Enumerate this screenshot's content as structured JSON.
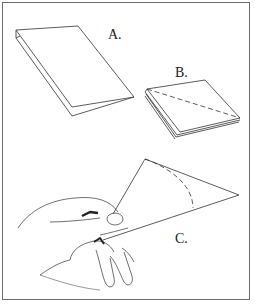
{
  "figure": {
    "panels": [
      {
        "id": "A",
        "label": "A.",
        "description": "Sheet of paper folded in half"
      },
      {
        "id": "B",
        "label": "B.",
        "description": "Paper folded again into a square with a diagonal dashed fold line"
      },
      {
        "id": "C",
        "label": "C.",
        "description": "Hand holding paper rolled into a cone with a dashed curved line"
      }
    ],
    "colors": {
      "line": "#333333",
      "border": "#6b6b6b",
      "background": "#ffffff"
    }
  }
}
